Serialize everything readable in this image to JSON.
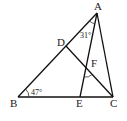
{
  "points": {
    "A": {
      "label": "A",
      "x": 97,
      "y": 13
    },
    "B": {
      "label": "B",
      "x": 18,
      "y": 97
    },
    "C": {
      "label": "C",
      "x": 113,
      "y": 97
    },
    "D": {
      "label": "D",
      "x": 66,
      "y": 46
    },
    "E": {
      "label": "E",
      "x": 80,
      "y": 97
    },
    "F": {
      "label": "F",
      "x": 86,
      "y": 68
    }
  },
  "angles": {
    "B": "47°",
    "DAE": "31°"
  }
}
